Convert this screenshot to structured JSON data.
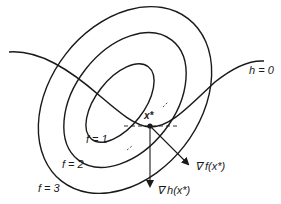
{
  "diagram": {
    "title": "",
    "labels": {
      "constraint": "h = 0",
      "contour_1": "f = 1",
      "contour_2": "f = 2",
      "contour_3": "f = 3",
      "optimum_point": "x*",
      "grad_f": "∇ f(x*)",
      "grad_h": "∇ h(x*)"
    },
    "colors": {
      "stroke": "#1a1a1a",
      "background": "#ffffff"
    }
  }
}
